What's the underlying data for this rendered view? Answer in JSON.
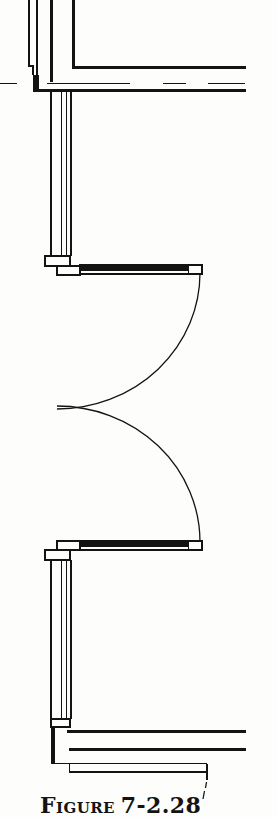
{
  "figure": {
    "caption_word": "Figure",
    "caption_number": "7-2.28"
  },
  "drawing": {
    "kind": "floor-plan-door-swing-detail",
    "parts": [
      "corner-wall-junction",
      "upper-horizontal-wall",
      "wall-dashed-centerline",
      "left-wall-upper-segment",
      "upper-door-assembly",
      "upper-door-swing-arc",
      "lower-door-swing-arc",
      "lower-door-assembly",
      "left-wall-lower-segment",
      "lower-wall-junction",
      "caption-leader-dashes"
    ]
  },
  "colors": {
    "ink": "#131313",
    "paper": "#fdfdfb"
  }
}
